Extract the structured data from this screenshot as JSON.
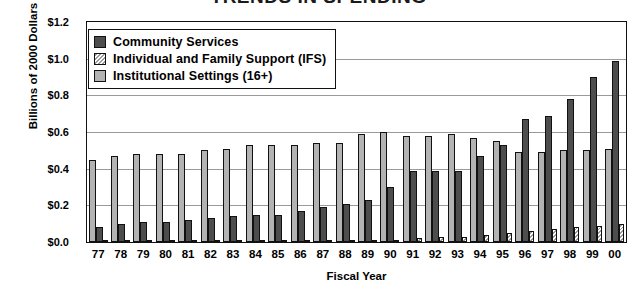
{
  "chart_data": {
    "type": "bar",
    "title": "TRENDS IN SPENDING",
    "xlabel": "Fiscal Year",
    "ylabel": "Billions of 2000 Dollars",
    "ylim": [
      0.0,
      1.2
    ],
    "ytick_step": 0.2,
    "ytick_labels": [
      "$1.2",
      "$1.0",
      "$0.8",
      "$0.6",
      "$0.4",
      "$0.2",
      "$0.0"
    ],
    "ytick_values": [
      1.2,
      1.0,
      0.8,
      0.6,
      0.4,
      0.2,
      0.0
    ],
    "grid": "horizontal",
    "legend_position": "top-left-inside",
    "categories": [
      "77",
      "78",
      "79",
      "80",
      "81",
      "82",
      "83",
      "84",
      "85",
      "86",
      "87",
      "88",
      "89",
      "90",
      "91",
      "92",
      "93",
      "94",
      "95",
      "96",
      "97",
      "98",
      "99",
      "00"
    ],
    "series": [
      {
        "name": "Institutional Settings (16+)",
        "color": "#b3b3b3",
        "values": [
          0.45,
          0.47,
          0.48,
          0.48,
          0.48,
          0.5,
          0.51,
          0.53,
          0.53,
          0.53,
          0.54,
          0.54,
          0.59,
          0.6,
          0.58,
          0.58,
          0.59,
          0.57,
          0.55,
          0.49,
          0.49,
          0.5,
          0.5,
          0.51
        ]
      },
      {
        "name": "Community Services",
        "color": "#4d4d4d",
        "values": [
          0.08,
          0.1,
          0.11,
          0.11,
          0.12,
          0.13,
          0.14,
          0.15,
          0.15,
          0.17,
          0.19,
          0.21,
          0.23,
          0.3,
          0.39,
          0.39,
          0.39,
          0.47,
          0.53,
          0.67,
          0.69,
          0.78,
          0.9,
          0.99
        ]
      },
      {
        "name": "Individual and Family Support (IFS)",
        "color": "#ffffff",
        "values": [
          0.01,
          0.01,
          0.01,
          0.01,
          0.01,
          0.01,
          0.01,
          0.01,
          0.01,
          0.01,
          0.01,
          0.01,
          0.01,
          0.01,
          0.02,
          0.03,
          0.03,
          0.04,
          0.05,
          0.06,
          0.07,
          0.08,
          0.09,
          0.1
        ]
      }
    ]
  },
  "legend": {
    "items": [
      {
        "label": "Community Services",
        "swatch": "comm"
      },
      {
        "label": "Individual and Family Support (IFS)",
        "swatch": "ifs"
      },
      {
        "label": "Institutional Settings (16+)",
        "swatch": "inst"
      }
    ]
  }
}
